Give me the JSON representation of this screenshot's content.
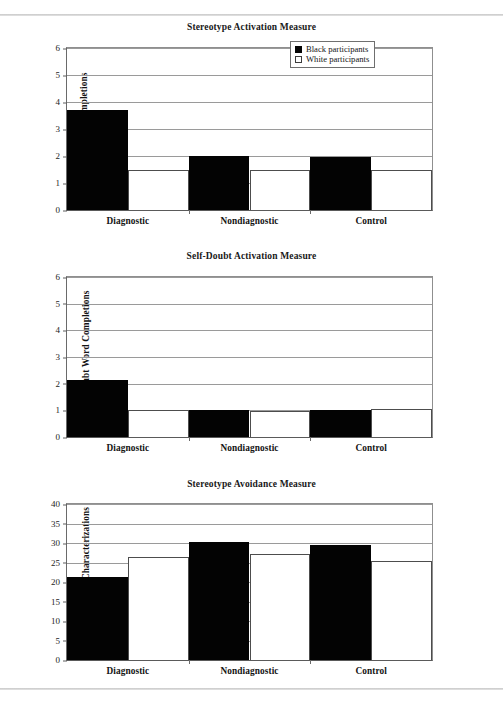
{
  "figure": {
    "legend": {
      "entries": [
        {
          "key": "black",
          "label": "Black participants",
          "swatch": "filled-black-square"
        },
        {
          "key": "white",
          "label": "White participants",
          "swatch": "hollow-white-square"
        }
      ]
    }
  },
  "chart_data": [
    {
      "type": "bar",
      "title": "Stereotype Activation Measure",
      "xlabel": "",
      "ylabel": "Racial Word Completions",
      "categories": [
        "Diagnostic",
        "Nondiagnostic",
        "Control"
      ],
      "series": [
        {
          "name": "Black participants",
          "values": [
            3.7,
            2.0,
            1.95
          ]
        },
        {
          "name": "White participants",
          "values": [
            1.5,
            1.5,
            1.5
          ]
        }
      ],
      "ylim": [
        0,
        6
      ],
      "yticks": [
        0,
        1,
        2,
        3,
        4,
        5,
        6
      ],
      "grid": true,
      "legend_position": "top-right"
    },
    {
      "type": "bar",
      "title": "Self-Doubt Activation Measure",
      "xlabel": "",
      "ylabel": "Self-Doubt Word Completions",
      "categories": [
        "Diagnostic",
        "Nondiagnostic",
        "Control"
      ],
      "series": [
        {
          "name": "Black participants",
          "values": [
            2.15,
            1.0,
            1.0
          ]
        },
        {
          "name": "White participants",
          "values": [
            1.0,
            0.97,
            1.05
          ]
        }
      ],
      "ylim": [
        0,
        6
      ],
      "yticks": [
        0,
        1,
        2,
        3,
        4,
        5,
        6
      ],
      "grid": true,
      "legend_position": "none"
    },
    {
      "type": "bar",
      "title": "Stereotype Avoidance Measure",
      "xlabel": "",
      "ylabel": "Stereotypic Self-Characterizations",
      "categories": [
        "Diagnostic",
        "Nondiagnostic",
        "Control"
      ],
      "series": [
        {
          "name": "Black participants",
          "values": [
            21.2,
            30.2,
            29.5
          ]
        },
        {
          "name": "White participants",
          "values": [
            26.5,
            27.2,
            25.4
          ]
        }
      ],
      "ylim": [
        0,
        40
      ],
      "yticks": [
        0,
        5,
        10,
        15,
        20,
        25,
        30,
        35,
        40
      ],
      "grid": true,
      "legend_position": "none"
    }
  ],
  "colors": {
    "black_series": "#030303",
    "white_series": "#ffffff",
    "series_outline": "#4d4d4d",
    "gridline": "#9a9a9a",
    "axis": "#5a5a5a",
    "text": "#141414"
  }
}
